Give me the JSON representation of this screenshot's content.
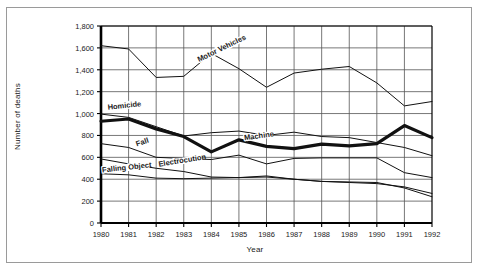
{
  "chart_data": {
    "type": "line",
    "title": "",
    "xlabel": "Year",
    "ylabel": "Number of deaths",
    "categories": [
      1980,
      1981,
      1982,
      1983,
      1984,
      1985,
      1986,
      1987,
      1988,
      1989,
      1990,
      1991,
      1992
    ],
    "x": [
      1980,
      1981,
      1982,
      1983,
      1984,
      1985,
      1986,
      1987,
      1988,
      1989,
      1990,
      1991,
      1992
    ],
    "xlim": [
      1980,
      1992
    ],
    "ylim": [
      0,
      1800
    ],
    "yticks": [
      0,
      200,
      400,
      600,
      800,
      1000,
      1200,
      1400,
      1600,
      1800
    ],
    "ytick_labels": [
      "0",
      "200",
      "400",
      "600",
      "800",
      "1,000",
      "1,200",
      "1,400",
      "1,600",
      "1,800"
    ],
    "xtick_labels": [
      "1980",
      "1981",
      "1982",
      "1983",
      "1984",
      "1985",
      "1986",
      "1987",
      "1988",
      "1989",
      "1990",
      "1991",
      "1992"
    ],
    "grid": true,
    "legend": "inline-labels",
    "series": [
      {
        "name": "Motor Vehicles",
        "emphasis": "normal",
        "label_position": {
          "x": 1983.55,
          "y": 1470,
          "rotate": -26
        },
        "values": [
          1620,
          1590,
          1330,
          1340,
          1550,
          1410,
          1240,
          1370,
          1405,
          1430,
          1280,
          1070,
          1110
        ]
      },
      {
        "name": "Homicide",
        "emphasis": "bold",
        "label_position": {
          "x": 1980.25,
          "y": 1035,
          "rotate": -6
        },
        "values": [
          930,
          950,
          860,
          790,
          650,
          760,
          700,
          680,
          720,
          705,
          725,
          890,
          780
        ]
      },
      {
        "name": "Machine",
        "emphasis": "normal",
        "label_position": {
          "x": 1985.2,
          "y": 755,
          "rotate": -8
        },
        "values": [
          995,
          965,
          880,
          795,
          825,
          840,
          800,
          830,
          790,
          780,
          735,
          690,
          615
        ]
      },
      {
        "name": "Fall",
        "emphasis": "normal",
        "label_position": {
          "x": 1981.3,
          "y": 700,
          "rotate": -18
        },
        "values": [
          725,
          690,
          600,
          590,
          580,
          620,
          540,
          590,
          595,
          595,
          595,
          460,
          415
        ]
      },
      {
        "name": "Electrocution",
        "emphasis": "normal",
        "label_position": {
          "x": 1982.1,
          "y": 515,
          "rotate": -9
        },
        "values": [
          585,
          540,
          500,
          470,
          420,
          415,
          430,
          400,
          380,
          370,
          360,
          330,
          270
        ]
      },
      {
        "name": "Falling Object",
        "emphasis": "normal",
        "label_position": {
          "x": 1980.05,
          "y": 462,
          "rotate": -6
        },
        "values": [
          450,
          440,
          410,
          405,
          410,
          415,
          420,
          400,
          380,
          375,
          370,
          320,
          240
        ]
      }
    ]
  },
  "colors": {
    "line": "#111111",
    "grid": "#555555",
    "axis": "#000000",
    "text": "#1a1a1a",
    "frame": "#9a9a9a",
    "background": "#ffffff"
  }
}
